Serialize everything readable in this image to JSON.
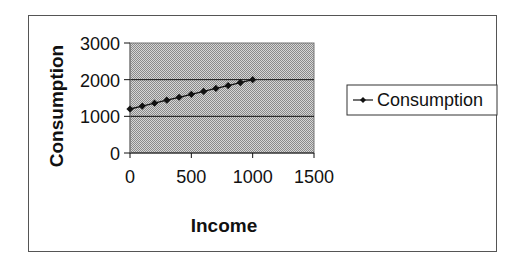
{
  "chart_data": {
    "type": "line",
    "title": "",
    "xlabel": "Income",
    "ylabel": "Consumption",
    "xlim": [
      0,
      1500
    ],
    "ylim": [
      0,
      3000
    ],
    "x_ticks": [
      0,
      500,
      1000,
      1500
    ],
    "y_ticks": [
      0,
      1000,
      2000,
      3000
    ],
    "x_tick_labels": [
      "0",
      "500",
      "1000",
      "1500"
    ],
    "y_tick_labels": [
      "0",
      "1000",
      "2000",
      "3000"
    ],
    "grid": "horizontal",
    "legend_position": "right",
    "plot_background": "#b8b8b8",
    "series": [
      {
        "name": "Consumption",
        "marker": "diamond",
        "color": "#111111",
        "x": [
          0,
          100,
          200,
          300,
          400,
          500,
          600,
          700,
          800,
          900,
          1000
        ],
        "values": [
          1200,
          1280,
          1360,
          1440,
          1520,
          1600,
          1680,
          1760,
          1840,
          1920,
          2000
        ]
      }
    ]
  }
}
